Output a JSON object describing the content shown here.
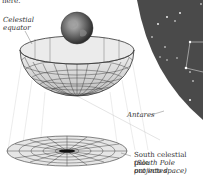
{
  "header": {
    "fragment": "here."
  },
  "labels": {
    "celestial_equator": [
      "Celestial",
      "equator"
    ],
    "antares": "Antares",
    "south_pole": [
      "South celestial pole",
      "(South Pole projected",
      "out into space)"
    ]
  },
  "colors": {
    "sky": "#4a4a4a",
    "star": "#ffffff",
    "constellation_line": "#d8d8d8",
    "grid": "#3a3a3a",
    "bowl_fill": "#e4e4e4",
    "text": "#333333"
  },
  "figure": {
    "elements": [
      "earth-globe",
      "celestial-hemisphere-bowl",
      "projected-polar-disc",
      "star-field-panel"
    ]
  }
}
